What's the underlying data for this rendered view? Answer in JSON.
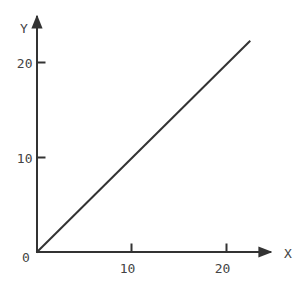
{
  "chart_data": {
    "type": "line",
    "title": "",
    "xlabel": "X",
    "ylabel": "Y",
    "xlim": [
      0,
      24.5
    ],
    "ylim": [
      0,
      24.5
    ],
    "grid": false,
    "legend": null,
    "origin_label": "0",
    "x_ticks": [
      10,
      20
    ],
    "x_tick_labels": [
      "10",
      "20"
    ],
    "y_ticks": [
      10,
      20
    ],
    "y_tick_labels": [
      "10",
      "20"
    ],
    "series": [
      {
        "name": "y = x",
        "x": [
          0,
          22.5
        ],
        "y": [
          0,
          22.5
        ]
      }
    ],
    "colors": {
      "axis": "#333333",
      "line": "#333333",
      "text": "#444444"
    }
  }
}
